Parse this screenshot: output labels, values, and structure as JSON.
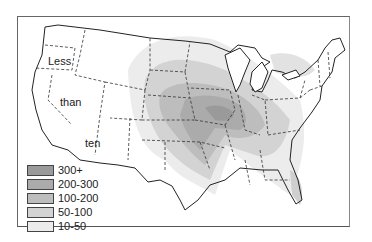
{
  "map": {
    "overlay_labels": [
      "Less",
      "than",
      "ten"
    ],
    "legend": [
      {
        "label": "300+",
        "color": "#9a9a9a"
      },
      {
        "label": "200-300",
        "color": "#ababab"
      },
      {
        "label": "100-200",
        "color": "#bdbdbd"
      },
      {
        "label": "50-100",
        "color": "#d3d3d3"
      },
      {
        "label": "10-50",
        "color": "#ececec"
      }
    ]
  }
}
